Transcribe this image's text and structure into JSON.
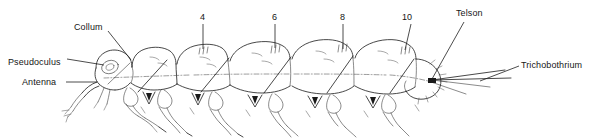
{
  "figure": {
    "kind": "scientific-line-drawing",
    "background_color": "#ffffff",
    "ink_color": "#1a1a1a",
    "width": 594,
    "height": 138
  },
  "labels": [
    {
      "id": "collum",
      "text": "Collum",
      "x": 74,
      "y": 27,
      "anchor": "start"
    },
    {
      "id": "pseudoculus",
      "text": "Pseudoculus",
      "x": 8,
      "y": 62,
      "anchor": "start"
    },
    {
      "id": "antenna",
      "text": "Antenna",
      "x": 22,
      "y": 85,
      "anchor": "start"
    },
    {
      "id": "telson",
      "text": "Telson",
      "x": 456,
      "y": 11,
      "anchor": "start"
    },
    {
      "id": "trichobothrium",
      "text": "Trichobothrium",
      "x": 521,
      "y": 64,
      "anchor": "start"
    }
  ],
  "segment_numbers": [
    {
      "id": "seg-4",
      "text": "4",
      "x": 200,
      "y": 14
    },
    {
      "id": "seg-6",
      "text": "6",
      "x": 272,
      "y": 14
    },
    {
      "id": "seg-8",
      "text": "8",
      "x": 340,
      "y": 14
    },
    {
      "id": "seg-10",
      "text": "10",
      "x": 404,
      "y": 14
    }
  ]
}
